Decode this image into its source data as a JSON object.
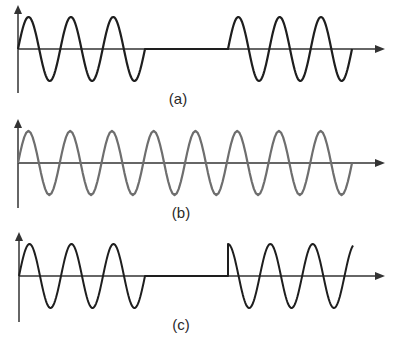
{
  "colors": {
    "background": "#ffffff",
    "axis": "#333333",
    "wave_dark": "#1e1e1e",
    "wave_gray": "#6e6e6e"
  },
  "panels": [
    {
      "id": "a",
      "label": "(a)",
      "label_pos": [
        178,
        104
      ],
      "axis": {
        "x0": 18,
        "y_top": 5,
        "y_bottom": 93,
        "baseline": 49,
        "x_end": 385
      },
      "amplitude": 32,
      "wave_color_key": "wave_dark",
      "stroke_width": 2.2,
      "segments": [
        {
          "type": "sine",
          "x_start": 18,
          "x_end": 145,
          "cycles": 3,
          "phase": "sin"
        },
        {
          "type": "flat",
          "x_start": 145,
          "x_end": 228
        },
        {
          "type": "sine",
          "x_start": 228,
          "x_end": 352,
          "cycles": 3,
          "phase": "sin"
        }
      ]
    },
    {
      "id": "b",
      "label": "(b)",
      "label_pos": [
        181,
        218
      ],
      "axis": {
        "x0": 18,
        "y_top": 119,
        "y_bottom": 208,
        "baseline": 163,
        "x_end": 385
      },
      "amplitude": 32,
      "wave_color_key": "wave_gray",
      "stroke_width": 2.2,
      "segments": [
        {
          "type": "sine",
          "x_start": 18,
          "x_end": 352,
          "cycles": 8,
          "phase": "sin"
        }
      ]
    },
    {
      "id": "c",
      "label": "(c)",
      "label_pos": [
        181,
        330
      ],
      "axis": {
        "x0": 19,
        "y_top": 232,
        "y_bottom": 322,
        "baseline": 276,
        "x_end": 385
      },
      "amplitude": 32,
      "wave_color_key": "wave_dark",
      "stroke_width": 2.0,
      "segments": [
        {
          "type": "sine",
          "x_start": 19,
          "x_end": 145,
          "cycles": 3,
          "phase": "sin"
        },
        {
          "type": "flat",
          "x_start": 145,
          "x_end": 228
        },
        {
          "type": "sine",
          "x_start": 228,
          "x_end": 353,
          "cycles": 2.95,
          "phase": "cos"
        }
      ]
    }
  ]
}
